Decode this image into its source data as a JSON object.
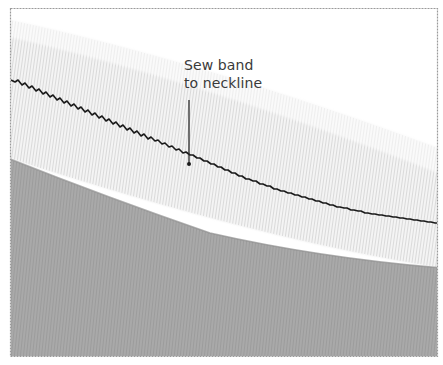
{
  "figure": {
    "callout": {
      "line1": "Sew band",
      "line2": "to neckline"
    },
    "colors": {
      "frame_border": "#9a9a9a",
      "garment_fabric": "#a8a8a8",
      "band_fabric": "#f4f4f4",
      "band_rib": "#cfcfcf",
      "stitch": "#1a1a1a",
      "leader_line": "#2a2a2a",
      "label_text": "#3a3a3a"
    }
  }
}
